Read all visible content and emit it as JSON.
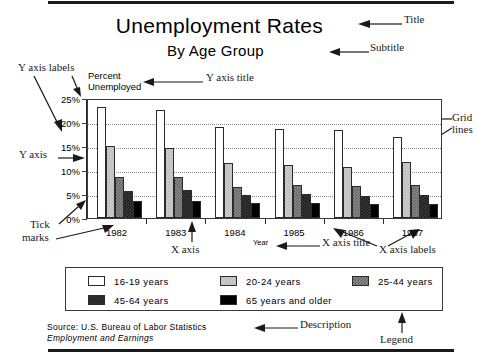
{
  "chart_data": {
    "type": "bar",
    "title": "Unemployment Rates",
    "subtitle": "By Age Group",
    "xlabel": "Year",
    "ylabel": "Percent Unemployed",
    "categories": [
      "1982",
      "1983",
      "1984",
      "1985",
      "1986",
      "1987"
    ],
    "ylim": [
      0,
      25
    ],
    "ytick_labels": [
      "0%",
      "5%",
      "10%",
      "15%",
      "20%",
      "25%"
    ],
    "ytick_values": [
      0,
      5,
      10,
      15,
      20,
      25
    ],
    "grid": true,
    "legend_position": "bottom",
    "series": [
      {
        "name": "16-19 years",
        "values": [
          23.2,
          22.4,
          18.9,
          18.6,
          18.3,
          16.9
        ]
      },
      {
        "name": "20-24 years",
        "values": [
          14.9,
          14.5,
          11.5,
          11.1,
          10.7,
          11.6
        ]
      },
      {
        "name": "25-44 years",
        "values": [
          8.6,
          8.6,
          6.5,
          6.8,
          6.7,
          6.8
        ]
      },
      {
        "name": "45-64 years",
        "values": [
          5.7,
          5.9,
          4.8,
          5.0,
          4.6,
          4.8
        ]
      },
      {
        "name": "65 years and older",
        "values": [
          3.5,
          3.6,
          3.1,
          3.1,
          3.0,
          3.0
        ]
      }
    ],
    "source_line1": "Source:  U.S. Bureau of Labor Statistics",
    "source_line2": "Employment and Earnings"
  },
  "annotations": {
    "title": "Title",
    "subtitle": "Subtitle",
    "y_axis_labels": "Y axis labels",
    "y_axis_title": "Y axis title",
    "y_axis": "Y axis",
    "tick_marks": "Tick\nmarks",
    "tick_marks_line1": "Tick",
    "tick_marks_line2": "marks",
    "x_axis": "X axis",
    "x_axis_title": "X axis title",
    "x_axis_labels": "X axis labels",
    "grid_lines_line1": "Grid",
    "grid_lines_line2": "lines",
    "description": "Description",
    "legend": "Legend"
  }
}
